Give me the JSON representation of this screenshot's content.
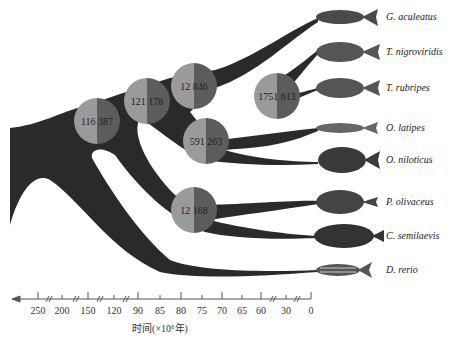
{
  "diagram": {
    "type": "phylogenetic-tree-with-gene-family-expansion",
    "colors": {
      "branch": "#2a2a2a",
      "node_left": "#9a9a9a",
      "node_right": "#5c5c5c",
      "axis": "#555555",
      "text": "#222222"
    },
    "nodes": [
      {
        "id": "n1",
        "left": "116",
        "right": "387",
        "cx": 97,
        "cy": 121
      },
      {
        "id": "n2",
        "left": "121",
        "right": "178",
        "cx": 147,
        "cy": 101
      },
      {
        "id": "n3",
        "left": "12",
        "right": "846",
        "cx": 194,
        "cy": 86
      },
      {
        "id": "n4",
        "left": "1751",
        "right": "613",
        "cx": 277,
        "cy": 96
      },
      {
        "id": "n5",
        "left": "591",
        "right": "263",
        "cx": 206,
        "cy": 141
      },
      {
        "id": "n6",
        "left": "12",
        "right": "168",
        "cx": 194,
        "cy": 210
      }
    ],
    "species": [
      {
        "name": "G. aculeatus",
        "y": 17
      },
      {
        "name": "T. nigroviridis",
        "y": 52
      },
      {
        "name": "T. rubripes",
        "y": 88
      },
      {
        "name": "O. latipes",
        "y": 128
      },
      {
        "name": "O. niloticus",
        "y": 160
      },
      {
        "name": "P. olivaceus",
        "y": 202
      },
      {
        "name": "C. semilaevis",
        "y": 236
      },
      {
        "name": "D. rerio",
        "y": 270
      }
    ]
  },
  "axis": {
    "title": "时间(×10⁶年)",
    "direction": "left-arrow",
    "ticks": [
      {
        "label": "250",
        "x": 38
      },
      {
        "label": "200",
        "x": 62
      },
      {
        "label": "150",
        "x": 88
      },
      {
        "label": "120",
        "x": 114
      },
      {
        "label": "90",
        "x": 138
      },
      {
        "label": "85",
        "x": 160
      },
      {
        "label": "80",
        "x": 181
      },
      {
        "label": "75",
        "x": 202
      },
      {
        "label": "70",
        "x": 222
      },
      {
        "label": "65",
        "x": 242
      },
      {
        "label": "60",
        "x": 261
      },
      {
        "label": "30",
        "x": 286
      },
      {
        "label": "0",
        "x": 310
      }
    ],
    "breaks_x": [
      49,
      76,
      100,
      126,
      273,
      297
    ]
  }
}
